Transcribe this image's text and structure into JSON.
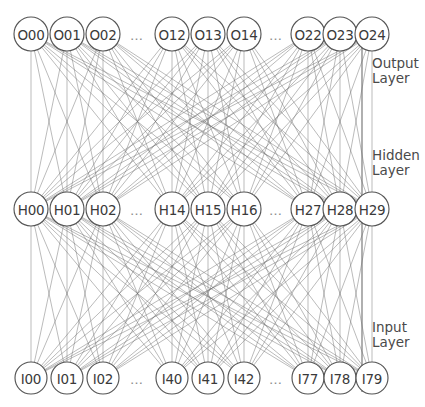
{
  "diagram": {
    "type": "fully-connected-network",
    "background_color": "#ffffff",
    "node_stroke_color": "#555555",
    "edge_color": "#6b6b6b",
    "label_color": "#4a4a4a",
    "ellipsis": "…",
    "canvas": {
      "width": 425,
      "height": 407
    }
  },
  "layers": [
    {
      "id": "output",
      "label_line1": "Output",
      "label_line2": "Layer",
      "row_y": 34,
      "node_radius": 17,
      "node_count_shown": 9,
      "slots": [
        {
          "kind": "node",
          "label": "O00",
          "x": 31
        },
        {
          "kind": "node",
          "label": "O01",
          "x": 67
        },
        {
          "kind": "node",
          "label": "O02",
          "x": 103
        },
        {
          "kind": "ellipsis",
          "label": "…",
          "x": 137
        },
        {
          "kind": "node",
          "label": "O12",
          "x": 172
        },
        {
          "kind": "node",
          "label": "O13",
          "x": 208
        },
        {
          "kind": "node",
          "label": "O14",
          "x": 244
        },
        {
          "kind": "ellipsis",
          "label": "…",
          "x": 276
        },
        {
          "kind": "node",
          "label": "O22",
          "x": 308
        },
        {
          "kind": "node",
          "label": "O23",
          "x": 340
        },
        {
          "kind": "node",
          "label": "O24",
          "x": 372
        }
      ]
    },
    {
      "id": "hidden",
      "label_line1": "Hidden",
      "label_line2": "Layer",
      "row_y": 209,
      "node_radius": 17,
      "node_count_shown": 9,
      "slots": [
        {
          "kind": "node",
          "label": "H00",
          "x": 31
        },
        {
          "kind": "node",
          "label": "H01",
          "x": 67
        },
        {
          "kind": "node",
          "label": "H02",
          "x": 103
        },
        {
          "kind": "ellipsis",
          "label": "…",
          "x": 137
        },
        {
          "kind": "node",
          "label": "H14",
          "x": 172
        },
        {
          "kind": "node",
          "label": "H15",
          "x": 208
        },
        {
          "kind": "node",
          "label": "H16",
          "x": 244
        },
        {
          "kind": "ellipsis",
          "label": "…",
          "x": 276
        },
        {
          "kind": "node",
          "label": "H27",
          "x": 308
        },
        {
          "kind": "node",
          "label": "H28",
          "x": 340
        },
        {
          "kind": "node",
          "label": "H29",
          "x": 372
        }
      ]
    },
    {
      "id": "input",
      "label_line1": "Input",
      "label_line2": "Layer",
      "row_y": 378,
      "node_radius": 16,
      "node_count_shown": 9,
      "slots": [
        {
          "kind": "node",
          "label": "I00",
          "x": 31
        },
        {
          "kind": "node",
          "label": "I01",
          "x": 67
        },
        {
          "kind": "node",
          "label": "I02",
          "x": 103
        },
        {
          "kind": "ellipsis",
          "label": "…",
          "x": 137
        },
        {
          "kind": "node",
          "label": "I40",
          "x": 172
        },
        {
          "kind": "node",
          "label": "I41",
          "x": 208
        },
        {
          "kind": "node",
          "label": "I42",
          "x": 244
        },
        {
          "kind": "ellipsis",
          "label": "…",
          "x": 276
        },
        {
          "kind": "node",
          "label": "I77",
          "x": 308
        },
        {
          "kind": "node",
          "label": "I78",
          "x": 340
        },
        {
          "kind": "node",
          "label": "I79",
          "x": 372
        }
      ]
    }
  ],
  "bracket": {
    "x": 362,
    "top_y": 46,
    "bottom_y": 392
  },
  "side_labels": [
    {
      "name": "output-layer-label",
      "line1": "Output",
      "line2": "Layer",
      "x": 372,
      "y": 56
    },
    {
      "name": "hidden-layer-label",
      "line1": "Hidden",
      "line2": "Layer",
      "x": 372,
      "y": 148
    },
    {
      "name": "input-layer-label",
      "line1": "Input",
      "line2": "Layer",
      "x": 372,
      "y": 320
    }
  ]
}
